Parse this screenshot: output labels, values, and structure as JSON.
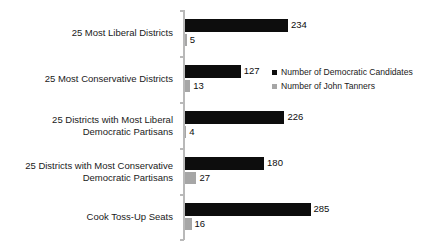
{
  "chart_data": {
    "type": "bar",
    "orientation": "horizontal",
    "title": "",
    "subtitle": "",
    "xlabel": "",
    "ylabel": "",
    "grid": false,
    "legend_position": "inside-right-upper",
    "axis_visible": "category-axis-only",
    "xlim": [
      0,
      285
    ],
    "categories": [
      "25 Most Liberal Districts",
      "25 Most Conservative Districts",
      "25 Districts with Most Liberal\nDemocratic Partisans",
      "25 Districts with Most Conservative\nDemocratic Partisans",
      "Cook Toss-Up Seats"
    ],
    "series": [
      {
        "name": "Number of Democratic Candidates",
        "color": "#0d0d0d",
        "values": [
          234,
          127,
          226,
          180,
          285
        ],
        "labels": [
          "234",
          "127",
          "226",
          "180",
          "285"
        ]
      },
      {
        "name": "Number of John Tanners",
        "color": "#a6a6a6",
        "values": [
          5,
          13,
          4,
          27,
          16
        ],
        "labels": [
          "5",
          "13",
          "4",
          "27",
          "16"
        ]
      }
    ]
  },
  "legend": {
    "items": [
      {
        "label": "Number of Democratic Candidates",
        "color": "#0d0d0d"
      },
      {
        "label": "Number of John Tanners",
        "color": "#a6a6a6"
      }
    ]
  }
}
